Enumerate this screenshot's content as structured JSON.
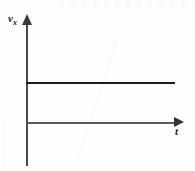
{
  "figure": {
    "kind": "kinematics-graph",
    "background_color": "#fefefe",
    "ink_color": "#1d1d1d",
    "axis_color": "#4a4a4a"
  },
  "axes": {
    "y": {
      "label_symbol": "v",
      "label_subscript": "x",
      "arrow_icon": "arrow-up-icon",
      "has_ticks": false,
      "has_numbers": false
    },
    "x": {
      "label_symbol": "t",
      "arrow_icon": "arrow-right-icon",
      "has_ticks": false,
      "has_numbers": false
    }
  },
  "chart_data": {
    "type": "line",
    "title": "",
    "subtitle": "",
    "xlabel": "t",
    "ylabel": "v_x",
    "grid": false,
    "legend": null,
    "xlim": [
      0,
      1
    ],
    "ylim": [
      0,
      1
    ],
    "axis_ticks": {
      "x": [],
      "y": []
    },
    "annotations": [],
    "series": [
      {
        "name": "v_x(t)",
        "description": "constant positive velocity",
        "color": "#1d1d1d",
        "x": [
          0,
          1
        ],
        "values": [
          0.62,
          0.62
        ]
      }
    ]
  }
}
